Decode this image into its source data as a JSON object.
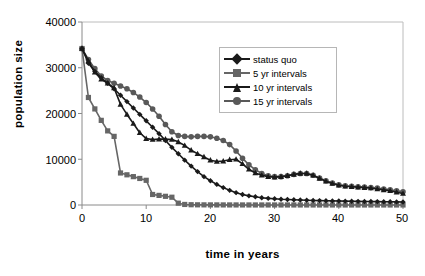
{
  "chart_data": {
    "type": "line",
    "title": "",
    "xlabel": "time in years",
    "ylabel": "population size",
    "xlim": [
      0,
      50
    ],
    "ylim": [
      0,
      40000
    ],
    "xticks": [
      "0",
      "10",
      "20",
      "30",
      "40",
      "50"
    ],
    "yticks": [
      "0",
      "10000",
      "20000",
      "30000",
      "40000"
    ],
    "grid": false,
    "legend_position": "upper-right",
    "x": [
      0,
      1,
      2,
      3,
      4,
      5,
      6,
      7,
      8,
      9,
      10,
      11,
      12,
      13,
      14,
      15,
      16,
      17,
      18,
      19,
      20,
      21,
      22,
      23,
      24,
      25,
      26,
      27,
      28,
      29,
      30,
      31,
      32,
      33,
      34,
      35,
      36,
      37,
      38,
      39,
      40,
      41,
      42,
      43,
      44,
      45,
      46,
      47,
      48,
      49,
      50
    ],
    "series": [
      {
        "name": "status quo",
        "marker": "diamond",
        "color": "#1a1a1a",
        "values": [
          34200,
          31000,
          29200,
          27800,
          26600,
          25400,
          24000,
          22600,
          21200,
          19800,
          18400,
          17000,
          15600,
          14100,
          12600,
          11200,
          9800,
          8500,
          7300,
          6200,
          5300,
          4500,
          3800,
          3200,
          2700,
          2300,
          2000,
          1800,
          1600,
          1450,
          1350,
          1250,
          1200,
          1150,
          1100,
          1050,
          1000,
          960,
          930,
          900,
          870,
          840,
          820,
          800,
          780,
          760,
          740,
          720,
          700,
          680,
          660
        ]
      },
      {
        "name": "5 yr intervals",
        "marker": "square",
        "color": "#666666",
        "values": [
          34200,
          23500,
          21000,
          18500,
          16200,
          15000,
          7000,
          6600,
          6200,
          5800,
          5400,
          2300,
          2100,
          1900,
          1700,
          400,
          120,
          60,
          40,
          30,
          25,
          20,
          18,
          15,
          14,
          12,
          11,
          10,
          10,
          9,
          9,
          8,
          8,
          7,
          7,
          7,
          6,
          6,
          6,
          5,
          5,
          5,
          5,
          4,
          4,
          4,
          4,
          4,
          3,
          3,
          3
        ]
      },
      {
        "name": "10 yr intervals",
        "marker": "triangle",
        "color": "#1a1a1a",
        "values": [
          34200,
          31500,
          29000,
          27500,
          26600,
          25600,
          22000,
          19800,
          17800,
          15800,
          14500,
          14300,
          14400,
          14400,
          14300,
          13800,
          13000,
          12000,
          11200,
          10500,
          9800,
          9500,
          9600,
          9900,
          10000,
          9000,
          7800,
          7000,
          6500,
          6200,
          6100,
          6200,
          6400,
          6700,
          6900,
          6900,
          6500,
          5800,
          5200,
          4700,
          4300,
          4100,
          4000,
          3900,
          3800,
          3700,
          3500,
          3300,
          3100,
          2800,
          2500
        ]
      },
      {
        "name": "15 yr intervals",
        "marker": "circle",
        "color": "#595959",
        "values": [
          34200,
          31800,
          29800,
          28200,
          27200,
          26600,
          26000,
          25400,
          24600,
          23600,
          22400,
          21000,
          19400,
          17600,
          16000,
          15200,
          15000,
          14900,
          15000,
          15000,
          14900,
          14600,
          14100,
          13200,
          11800,
          10200,
          8800,
          7700,
          6900,
          6400,
          6200,
          6200,
          6400,
          6700,
          6900,
          6900,
          6500,
          5900,
          5300,
          4800,
          4400,
          4200,
          4100,
          4000,
          3900,
          3800,
          3700,
          3500,
          3300,
          3100,
          2900
        ]
      }
    ]
  },
  "legend": {
    "entries": [
      {
        "label": "status quo"
      },
      {
        "label": "5 yr intervals"
      },
      {
        "label": "10 yr intervals"
      },
      {
        "label": "15 yr intervals"
      }
    ]
  },
  "axes": {
    "y_title": "population size",
    "x_title": "time in years"
  }
}
